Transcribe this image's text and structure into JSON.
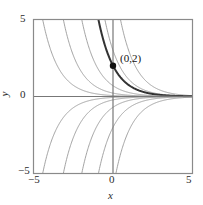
{
  "chart_data": {
    "type": "line",
    "title": "",
    "xlabel": "x",
    "ylabel": "y",
    "xlim": [
      -5,
      5
    ],
    "ylim": [
      -5,
      5
    ],
    "grid": false,
    "legend": null,
    "xticks": [
      -5,
      0,
      5
    ],
    "yticks": [
      -5,
      0,
      5
    ],
    "xtick_labels": [
      "−5",
      "0",
      "5"
    ],
    "ytick_labels": [
      "−5",
      "0",
      "5"
    ],
    "annotations": [
      {
        "text": "(0,2)",
        "x": 0,
        "y": 2,
        "marker": "filled-circle",
        "marker_color": "#111111"
      }
    ],
    "series": [
      {
        "name": "C = 8",
        "C": 8,
        "color": "#999999",
        "width": 0.9,
        "emphasis": false
      },
      {
        "name": "C = 3",
        "C": 3,
        "color": "#999999",
        "width": 0.9,
        "emphasis": false
      },
      {
        "name": "C = 2",
        "C": 2,
        "color": "#333333",
        "width": 2.0,
        "emphasis": true
      },
      {
        "name": "C = 0.7",
        "C": 0.7,
        "color": "#999999",
        "width": 0.9,
        "emphasis": false
      },
      {
        "name": "C = 0.22",
        "C": 0.22,
        "color": "#999999",
        "width": 0.9,
        "emphasis": false
      },
      {
        "name": "C = 0.06",
        "C": 0.06,
        "color": "#999999",
        "width": 0.9,
        "emphasis": false
      },
      {
        "name": "C = 0",
        "C": 0,
        "color": "#666666",
        "width": 1.0,
        "emphasis": false
      },
      {
        "name": "C = -0.06",
        "C": -0.06,
        "color": "#999999",
        "width": 0.9,
        "emphasis": false
      },
      {
        "name": "C = -0.22",
        "C": -0.22,
        "color": "#999999",
        "width": 0.9,
        "emphasis": false
      },
      {
        "name": "C = -0.7",
        "C": -0.7,
        "color": "#999999",
        "width": 0.9,
        "emphasis": false
      },
      {
        "name": "C = -2",
        "C": -2,
        "color": "#999999",
        "width": 0.9,
        "emphasis": false
      },
      {
        "name": "C = -6",
        "C": -6,
        "color": "#999999",
        "width": 0.9,
        "emphasis": false
      }
    ]
  },
  "axes": {
    "x_label": "x",
    "y_label": "y",
    "x_tick_left": "−5",
    "x_tick_zero": "0",
    "x_tick_right": "5",
    "y_tick_top": "5",
    "y_tick_zero": "0",
    "y_tick_bottom": "−5"
  },
  "point": {
    "label": "(0,2)"
  },
  "colors": {
    "frame": "#8a8a8a",
    "axis": "#777777",
    "curve": "#9a9a9a",
    "curve_bold": "#2f2f2f",
    "marker": "#111111",
    "background": "#ffffff"
  }
}
